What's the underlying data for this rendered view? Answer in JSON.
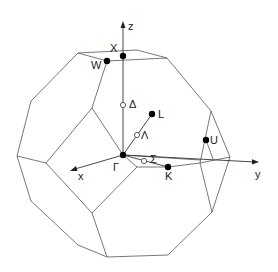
{
  "diagram": {
    "axes": {
      "x": "x",
      "y": "y",
      "z": "z"
    },
    "points": [
      {
        "id": "gamma",
        "label": "Γ",
        "x": 123,
        "y": 155,
        "filled": true
      },
      {
        "id": "X",
        "label": "X",
        "x": 123,
        "y": 56,
        "filled": true
      },
      {
        "id": "W",
        "label": "W",
        "x": 107,
        "y": 61,
        "filled": true
      },
      {
        "id": "L",
        "label": "L",
        "x": 152,
        "y": 114,
        "filled": true
      },
      {
        "id": "K",
        "label": "K",
        "x": 168,
        "y": 167,
        "filled": true
      },
      {
        "id": "U",
        "label": "U",
        "x": 206,
        "y": 140,
        "filled": true
      },
      {
        "id": "delta",
        "label": "Δ",
        "x": 123,
        "y": 105,
        "filled": false
      },
      {
        "id": "lambda",
        "label": "Λ",
        "x": 137,
        "y": 135,
        "filled": false
      },
      {
        "id": "sigma",
        "label": "Σ",
        "x": 144,
        "y": 161,
        "filled": false
      }
    ],
    "colors": {
      "line": "#444444",
      "point": "#000000",
      "background": "#ffffff"
    }
  }
}
